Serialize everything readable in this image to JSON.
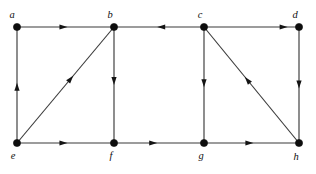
{
  "figure": {
    "type": "directed-graph-diagram",
    "background_color": "#ffffff",
    "node_color": "#0d0d0d",
    "edge_color": "#3a3a3a",
    "label_color": "#0f0f0f",
    "width": 316,
    "height": 174
  },
  "nodes": [
    {
      "id": "a",
      "label": "a",
      "x": 17,
      "y": 27,
      "label_x": 12,
      "label_y": 18
    },
    {
      "id": "b",
      "label": "b",
      "x": 114,
      "y": 27,
      "label_x": 110,
      "label_y": 18
    },
    {
      "id": "c",
      "label": "c",
      "x": 204,
      "y": 27,
      "label_x": 200,
      "label_y": 18
    },
    {
      "id": "d",
      "label": "d",
      "x": 299,
      "y": 27,
      "label_x": 295,
      "label_y": 18
    },
    {
      "id": "e",
      "label": "e",
      "x": 17,
      "y": 143,
      "label_x": 13,
      "label_y": 159
    },
    {
      "id": "f",
      "label": "f",
      "x": 114,
      "y": 143,
      "label_x": 111,
      "label_y": 159
    },
    {
      "id": "g",
      "label": "g",
      "x": 204,
      "y": 143,
      "label_x": 201,
      "label_y": 159
    },
    {
      "id": "h",
      "label": "h",
      "x": 299,
      "y": 143,
      "label_x": 296,
      "label_y": 160
    }
  ],
  "edges": [
    {
      "id": "a-b",
      "from": "a",
      "to": "b",
      "kind": "horizontal",
      "arrow_at": 0.52
    },
    {
      "id": "c-b",
      "from": "c",
      "to": "b",
      "kind": "horizontal",
      "arrow_at": 0.52
    },
    {
      "id": "c-d",
      "from": "c",
      "to": "d",
      "kind": "horizontal",
      "arrow_at": 0.88
    },
    {
      "id": "e-a",
      "from": "e",
      "to": "a",
      "kind": "vertical",
      "arrow_at": 0.52
    },
    {
      "id": "b-f",
      "from": "b",
      "to": "f",
      "kind": "vertical",
      "arrow_at": 0.5
    },
    {
      "id": "c-g",
      "from": "c",
      "to": "g",
      "kind": "vertical",
      "arrow_at": 0.52
    },
    {
      "id": "d-h",
      "from": "d",
      "to": "h",
      "kind": "vertical",
      "arrow_at": 0.53
    },
    {
      "id": "e-f",
      "from": "e",
      "to": "f",
      "kind": "horizontal",
      "arrow_at": 0.52
    },
    {
      "id": "f-g",
      "from": "f",
      "to": "g",
      "kind": "horizontal",
      "arrow_at": 0.48
    },
    {
      "id": "g-h",
      "from": "g",
      "to": "h",
      "kind": "horizontal",
      "arrow_at": 0.52
    },
    {
      "id": "e-b",
      "from": "e",
      "to": "b",
      "kind": "diagonal",
      "arrow_at": 0.58
    },
    {
      "id": "h-c",
      "from": "h",
      "to": "c",
      "kind": "diagonal",
      "arrow_at": 0.57
    }
  ],
  "style": {
    "node_radius": 3.6,
    "arrow_length": 8.0,
    "arrow_width": 5.2,
    "edge_stroke_width": 1.15
  }
}
